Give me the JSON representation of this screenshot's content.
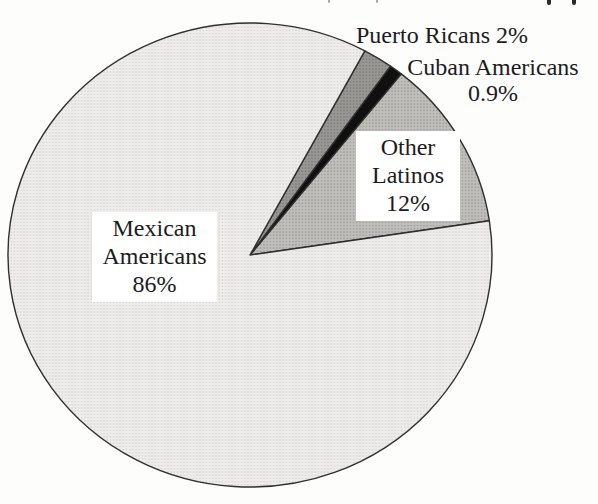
{
  "chart_data": {
    "type": "pie",
    "title": "",
    "slices": [
      {
        "label": "Mexican Americans",
        "value": 86,
        "display_pct": "86%",
        "texture": "halftone-light",
        "color": "#e9e8e6"
      },
      {
        "label": "Other Latinos",
        "value": 12,
        "display_pct": "12%",
        "texture": "halftone-mid",
        "color": "#b3b1ae"
      },
      {
        "label": "Cuban Americans",
        "value": 0.9,
        "display_pct": "0.9%",
        "texture": "solid",
        "color": "#101010"
      },
      {
        "label": "Puerto Ricans",
        "value": 2,
        "display_pct": "2%",
        "texture": "halftone-dark",
        "color": "#8d8c8a"
      }
    ],
    "layout": {
      "cx": 250,
      "cy": 255,
      "rx": 242,
      "ry": 232,
      "start_angle_deg": 8.5,
      "direction": "ccw",
      "order": [
        "Other Latinos",
        "Cuban Americans",
        "Puerto Ricans",
        "Mexican Americans"
      ],
      "outline_color": "#2f2f2f",
      "legend": "none",
      "labels_inline": true
    }
  },
  "labels": {
    "mexican": {
      "line1": "Mexican",
      "line2": "Americans",
      "line3": "86%"
    },
    "other": {
      "line1": "Other",
      "line2": "Latinos",
      "line3": "12%"
    },
    "puerto_rican": {
      "text": "Puerto Ricans 2%"
    },
    "cuban": {
      "line1": "Cuban Americans",
      "line2": "0.9%"
    }
  }
}
